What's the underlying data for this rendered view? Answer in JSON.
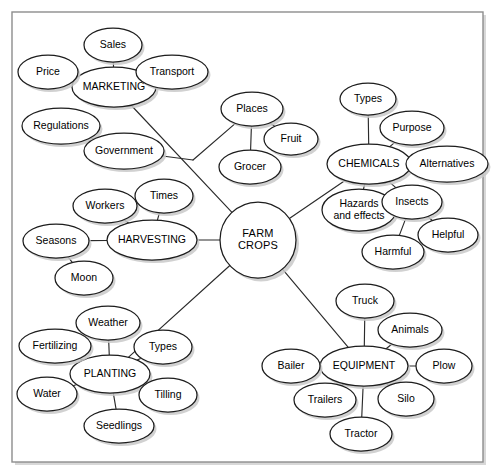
{
  "diagram": {
    "type": "mind-map",
    "background_color": "#ffffff",
    "frame_color": "#8d8d8d",
    "node_fill": "#ffffff",
    "node_stroke": "#1d1d1d",
    "edge_color": "#2b2b2b",
    "frame": {
      "x": 12,
      "y": 12,
      "width": 471,
      "height": 450
    },
    "center_node": {
      "id": "farm-crops",
      "label_line1": "FARM",
      "label_line2": "CROPS",
      "shape": "circle",
      "cx": 258,
      "cy": 240,
      "r": 38
    },
    "nodes": [
      {
        "id": "marketing",
        "label": "MARKETING",
        "cx": 114,
        "cy": 87,
        "rx": 42,
        "ry": 20,
        "kind": "hub"
      },
      {
        "id": "sales",
        "label": "Sales",
        "cx": 113,
        "cy": 45,
        "rx": 29,
        "ry": 17,
        "kind": "leaf"
      },
      {
        "id": "price",
        "label": "Price",
        "cx": 48,
        "cy": 72,
        "rx": 30,
        "ry": 17,
        "kind": "leaf"
      },
      {
        "id": "transport",
        "label": "Transport",
        "cx": 172,
        "cy": 72,
        "rx": 36,
        "ry": 17,
        "kind": "leaf"
      },
      {
        "id": "regulations",
        "label": "Regulations",
        "cx": 61,
        "cy": 126,
        "rx": 39,
        "ry": 18,
        "kind": "leaf"
      },
      {
        "id": "government",
        "label": "Government",
        "cx": 124,
        "cy": 151,
        "rx": 40,
        "ry": 18,
        "kind": "leaf"
      },
      {
        "id": "places",
        "label": "Places",
        "cx": 252,
        "cy": 109,
        "rx": 31,
        "ry": 17,
        "kind": "leaf"
      },
      {
        "id": "fruit",
        "label": "Fruit",
        "cx": 291,
        "cy": 139,
        "rx": 27,
        "ry": 16,
        "kind": "leaf"
      },
      {
        "id": "grocer",
        "label": "Grocer",
        "cx": 250,
        "cy": 167,
        "rx": 31,
        "ry": 17,
        "kind": "leaf"
      },
      {
        "id": "chemicals",
        "label": "CHEMICALS",
        "cx": 369,
        "cy": 164,
        "rx": 42,
        "ry": 20,
        "kind": "hub"
      },
      {
        "id": "types-chem",
        "label": "Types",
        "cx": 368,
        "cy": 99,
        "rx": 28,
        "ry": 16,
        "kind": "leaf"
      },
      {
        "id": "purpose",
        "label": "Purpose",
        "cx": 412,
        "cy": 128,
        "rx": 32,
        "ry": 17,
        "kind": "leaf"
      },
      {
        "id": "alternatives",
        "label": "Alternatives",
        "cx": 447,
        "cy": 164,
        "rx": 41,
        "ry": 18,
        "kind": "leaf"
      },
      {
        "id": "hazards",
        "label": "Hazards",
        "label2": "and effects",
        "cx": 359,
        "cy": 210,
        "rx": 37,
        "ry": 21,
        "kind": "leaf"
      },
      {
        "id": "insects",
        "label": "Insects",
        "cx": 412,
        "cy": 202,
        "rx": 30,
        "ry": 17,
        "kind": "leaf"
      },
      {
        "id": "harmful",
        "label": "Harmful",
        "cx": 393,
        "cy": 252,
        "rx": 31,
        "ry": 17,
        "kind": "leaf"
      },
      {
        "id": "helpful",
        "label": "Helpful",
        "cx": 448,
        "cy": 235,
        "rx": 30,
        "ry": 17,
        "kind": "leaf"
      },
      {
        "id": "harvesting",
        "label": "HARVESTING",
        "cx": 152,
        "cy": 240,
        "rx": 45,
        "ry": 20,
        "kind": "hub"
      },
      {
        "id": "workers",
        "label": "Workers",
        "cx": 105,
        "cy": 206,
        "rx": 32,
        "ry": 17,
        "kind": "leaf"
      },
      {
        "id": "times",
        "label": "Times",
        "cx": 164,
        "cy": 196,
        "rx": 29,
        "ry": 17,
        "kind": "leaf"
      },
      {
        "id": "seasons",
        "label": "Seasons",
        "cx": 56,
        "cy": 241,
        "rx": 33,
        "ry": 17,
        "kind": "leaf"
      },
      {
        "id": "moon",
        "label": "Moon",
        "cx": 84,
        "cy": 278,
        "rx": 29,
        "ry": 17,
        "kind": "leaf"
      },
      {
        "id": "planting",
        "label": "PLANTING",
        "cx": 110,
        "cy": 374,
        "rx": 40,
        "ry": 19,
        "kind": "hub"
      },
      {
        "id": "weather",
        "label": "Weather",
        "cx": 108,
        "cy": 323,
        "rx": 32,
        "ry": 17,
        "kind": "leaf"
      },
      {
        "id": "fertilizing",
        "label": "Fertilizing",
        "cx": 55,
        "cy": 346,
        "rx": 36,
        "ry": 17,
        "kind": "leaf"
      },
      {
        "id": "types-plant",
        "label": "Types",
        "cx": 163,
        "cy": 347,
        "rx": 29,
        "ry": 17,
        "kind": "leaf"
      },
      {
        "id": "water",
        "label": "Water",
        "cx": 47,
        "cy": 394,
        "rx": 30,
        "ry": 17,
        "kind": "leaf"
      },
      {
        "id": "tilling",
        "label": "Tilling",
        "cx": 168,
        "cy": 395,
        "rx": 29,
        "ry": 17,
        "kind": "leaf"
      },
      {
        "id": "seedlings",
        "label": "Seedlings",
        "cx": 119,
        "cy": 426,
        "rx": 35,
        "ry": 17,
        "kind": "leaf"
      },
      {
        "id": "equipment",
        "label": "EQUIPMENT",
        "cx": 364,
        "cy": 366,
        "rx": 44,
        "ry": 20,
        "kind": "hub"
      },
      {
        "id": "truck",
        "label": "Truck",
        "cx": 365,
        "cy": 301,
        "rx": 29,
        "ry": 17,
        "kind": "leaf"
      },
      {
        "id": "animals",
        "label": "Animals",
        "cx": 410,
        "cy": 330,
        "rx": 32,
        "ry": 17,
        "kind": "leaf"
      },
      {
        "id": "plow",
        "label": "Plow",
        "cx": 444,
        "cy": 366,
        "rx": 28,
        "ry": 17,
        "kind": "leaf"
      },
      {
        "id": "bailer",
        "label": "Bailer",
        "cx": 291,
        "cy": 366,
        "rx": 29,
        "ry": 17,
        "kind": "leaf"
      },
      {
        "id": "trailers",
        "label": "Trailers",
        "cx": 325,
        "cy": 400,
        "rx": 31,
        "ry": 17,
        "kind": "leaf"
      },
      {
        "id": "silo",
        "label": "Silo",
        "cx": 406,
        "cy": 399,
        "rx": 28,
        "ry": 17,
        "kind": "leaf"
      },
      {
        "id": "tractor",
        "label": "Tractor",
        "cx": 361,
        "cy": 434,
        "rx": 31,
        "ry": 17,
        "kind": "leaf"
      }
    ],
    "junctions": [
      {
        "id": "j-marketing-branch",
        "x": 193,
        "y": 160
      }
    ],
    "edges": [
      {
        "from": "sales",
        "to": "marketing"
      },
      {
        "from": "price",
        "to": "marketing"
      },
      {
        "from": "transport",
        "to": "marketing"
      },
      {
        "from": "regulations",
        "to": "government"
      },
      {
        "from": "government",
        "to": "j-marketing-branch"
      },
      {
        "from": "marketing",
        "to": "farm-crops"
      },
      {
        "from": "places",
        "to": "j-marketing-branch"
      },
      {
        "from": "places",
        "to": "grocer"
      },
      {
        "from": "places",
        "to": "fruit"
      },
      {
        "from": "farm-crops",
        "to": "chemicals"
      },
      {
        "from": "types-chem",
        "to": "chemicals"
      },
      {
        "from": "purpose",
        "to": "chemicals"
      },
      {
        "from": "alternatives",
        "to": "chemicals"
      },
      {
        "from": "hazards",
        "to": "chemicals"
      },
      {
        "from": "insects",
        "to": "chemicals"
      },
      {
        "from": "harmful",
        "to": "insects"
      },
      {
        "from": "helpful",
        "to": "insects"
      },
      {
        "from": "harvesting",
        "to": "farm-crops"
      },
      {
        "from": "workers",
        "to": "harvesting"
      },
      {
        "from": "times",
        "to": "harvesting"
      },
      {
        "from": "seasons",
        "to": "harvesting"
      },
      {
        "from": "moon",
        "to": "seasons"
      },
      {
        "from": "planting",
        "to": "farm-crops"
      },
      {
        "from": "weather",
        "to": "planting"
      },
      {
        "from": "fertilizing",
        "to": "planting"
      },
      {
        "from": "types-plant",
        "to": "planting"
      },
      {
        "from": "water",
        "to": "planting"
      },
      {
        "from": "tilling",
        "to": "planting"
      },
      {
        "from": "seedlings",
        "to": "planting"
      },
      {
        "from": "equipment",
        "to": "farm-crops"
      },
      {
        "from": "truck",
        "to": "equipment"
      },
      {
        "from": "animals",
        "to": "equipment"
      },
      {
        "from": "plow",
        "to": "equipment"
      },
      {
        "from": "bailer",
        "to": "equipment"
      },
      {
        "from": "trailers",
        "to": "equipment"
      },
      {
        "from": "silo",
        "to": "equipment"
      },
      {
        "from": "tractor",
        "to": "equipment"
      }
    ]
  }
}
